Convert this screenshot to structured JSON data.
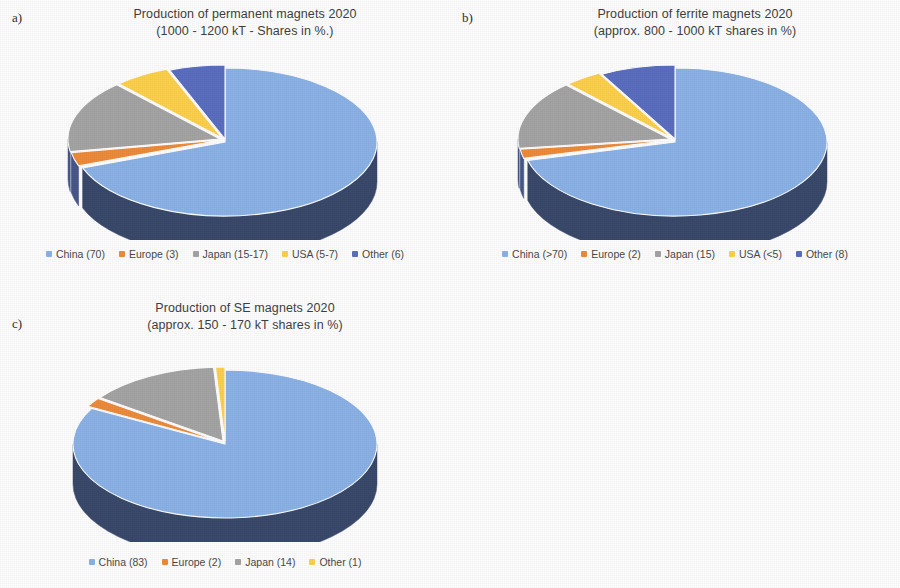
{
  "figure": {
    "background": "#ffffff"
  },
  "palette": {
    "china": "#8cb3e8",
    "europe": "#ed8c3c",
    "japan": "#a5a5a5",
    "usa": "#ffd24d",
    "other": "#5b6fc0",
    "side_wall": "#3a4a6b",
    "side_wall_light": "#47588a",
    "edge": "#ffffff"
  },
  "panels": {
    "a": {
      "label": "a)",
      "title_line1": "Production of permanent magnets 2020",
      "title_line2": "(1000 - 1200 kT - Shares in %.)"
    },
    "b": {
      "label": "b)",
      "title_line1": "Production of ferrite magnets 2020",
      "title_line2": "(approx. 800 - 1000 kT shares in %)"
    },
    "c": {
      "label": "c)",
      "title_line1": "Production of SE magnets 2020",
      "title_line2": "(approx. 150 - 170 kT shares in %)"
    }
  },
  "chart_data": [
    {
      "id": "a",
      "type": "pie",
      "title": "Production of permanent magnets 2020 (1000 - 1200 kT - Shares in %.)",
      "subtitle": "(1000 - 1200 kT - Shares in %.)",
      "unit": "%",
      "threed": true,
      "start_angle": 0,
      "direction": "clockwise",
      "categories": [
        "China",
        "Europe",
        "Japan",
        "USA",
        "Other"
      ],
      "legend_labels": [
        "China (70)",
        "Europe (3)",
        "Japan (15-17)",
        "USA (5-7)",
        "Other (6)"
      ],
      "values": [
        70,
        3,
        16,
        6,
        6
      ],
      "value_labels": [
        "70",
        "3",
        "15-17",
        "5-7",
        "6"
      ],
      "colors": [
        "#8cb3e8",
        "#ed8c3c",
        "#a5a5a5",
        "#ffd24d",
        "#5b6fc0"
      ],
      "legend_position": "bottom"
    },
    {
      "id": "b",
      "type": "pie",
      "title": "Production of ferrite magnets 2020 (approx. 800 - 1000 kT shares in %)",
      "subtitle": "(approx. 800 - 1000 kT shares in %)",
      "unit": "%",
      "threed": true,
      "start_angle": 0,
      "direction": "clockwise",
      "categories": [
        "China",
        "Europe",
        "Japan",
        "USA",
        "Other"
      ],
      "legend_labels": [
        "China (>70)",
        "Europe (2)",
        "Japan (15)",
        "USA (<5)",
        "Other  (8)"
      ],
      "values": [
        71,
        2,
        15,
        4,
        8
      ],
      "value_labels": [
        ">70",
        "2",
        "15",
        "<5",
        "8"
      ],
      "colors": [
        "#8cb3e8",
        "#ed8c3c",
        "#a5a5a5",
        "#ffd24d",
        "#5b6fc0"
      ],
      "legend_position": "bottom"
    },
    {
      "id": "c",
      "type": "pie",
      "title": "Production of SE magnets 2020 (approx. 150 - 170 kT shares in %)",
      "subtitle": "(approx. 150 - 170 kT shares in %)",
      "unit": "%",
      "threed": true,
      "start_angle": 0,
      "direction": "clockwise",
      "categories": [
        "China",
        "Europe",
        "Japan",
        "Other"
      ],
      "legend_labels": [
        "China (83)",
        "Europe (2)",
        "Japan (14)",
        "Other (1)"
      ],
      "values": [
        83,
        2,
        14,
        1
      ],
      "value_labels": [
        "83",
        "2",
        "14",
        "1"
      ],
      "colors": [
        "#8cb3e8",
        "#ed8c3c",
        "#a5a5a5",
        "#ffd24d"
      ],
      "legend_position": "bottom"
    }
  ]
}
